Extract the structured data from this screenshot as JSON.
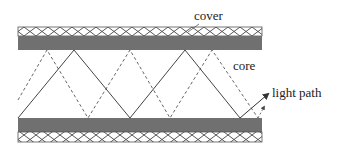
{
  "diagram": {
    "labels": {
      "cover": "cover",
      "core": "core",
      "light_path": "light path"
    },
    "colors": {
      "cladding_band": "#707070",
      "hatch_line": "#444444",
      "solid_path": "#444444",
      "dashed_path": "#555555",
      "text": "#222222"
    },
    "geometry": {
      "left": 18,
      "right": 262,
      "top_cover": [
        27,
        36
      ],
      "top_band": [
        36,
        50
      ],
      "bottom_band": [
        118,
        132
      ],
      "bottom_cover": [
        132,
        142
      ]
    },
    "solid_path_points": [
      [
        18,
        118
      ],
      [
        74,
        50
      ],
      [
        130,
        118
      ],
      [
        185,
        50
      ],
      [
        240,
        118
      ],
      [
        268,
        94
      ]
    ],
    "dashed_path_points": [
      [
        18,
        100
      ],
      [
        47,
        50
      ],
      [
        88,
        118
      ],
      [
        130,
        50
      ],
      [
        170,
        118
      ],
      [
        212,
        50
      ],
      [
        258,
        118
      ]
    ],
    "dashed_arrow": [
      [
        258,
        118
      ],
      [
        263,
        108
      ]
    ]
  }
}
